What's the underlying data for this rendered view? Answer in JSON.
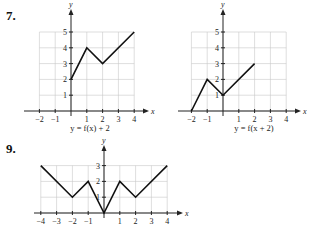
{
  "problems": [
    {
      "number": "7.",
      "caption": "y = f(x) + 2"
    },
    {
      "number": "",
      "caption": "y = f(x + 2)"
    },
    {
      "number": "9.",
      "caption": ""
    }
  ],
  "chart_data": [
    {
      "type": "line",
      "title": "y = f(x) + 2",
      "xlabel": "x",
      "ylabel": "y",
      "xlim": [
        -2,
        4
      ],
      "ylim": [
        0,
        5
      ],
      "x_ticks": [
        -2,
        -1,
        1,
        2,
        3,
        4
      ],
      "y_ticks": [
        1,
        2,
        3,
        4,
        5
      ],
      "grid": true,
      "x": [
        0,
        1,
        2,
        4
      ],
      "values": [
        2,
        4,
        3,
        5
      ]
    },
    {
      "type": "line",
      "title": "y = f(x + 2)",
      "xlabel": "x",
      "ylabel": "y",
      "xlim": [
        -2,
        4
      ],
      "ylim": [
        0,
        5
      ],
      "x_ticks": [
        -2,
        -1,
        1,
        2,
        3,
        4
      ],
      "y_ticks": [
        1,
        2,
        3,
        4,
        5
      ],
      "grid": true,
      "x": [
        -2,
        -1,
        0,
        2
      ],
      "values": [
        0,
        2,
        1,
        3
      ]
    },
    {
      "type": "line",
      "title": "",
      "xlabel": "x",
      "ylabel": "y",
      "xlim": [
        -4,
        4
      ],
      "ylim": [
        0,
        3
      ],
      "x_ticks": [
        -4,
        -3,
        -2,
        -1,
        1,
        2,
        3,
        4
      ],
      "y_ticks": [
        1,
        2,
        3
      ],
      "grid": true,
      "x": [
        -4,
        -2,
        -1,
        0,
        1,
        2,
        4
      ],
      "values": [
        3,
        1,
        2,
        0,
        2,
        1,
        3
      ]
    }
  ]
}
